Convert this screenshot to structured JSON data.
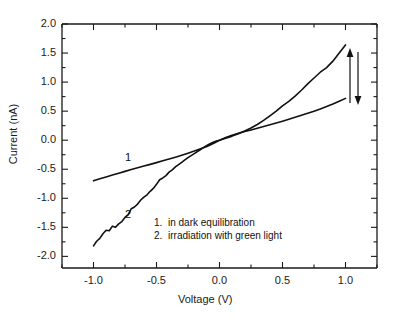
{
  "figure": {
    "background_color": "#ffffff",
    "line_color": "#111111",
    "axis_color": "#1a1a1a",
    "bottom_fragment": ""
  },
  "chart_data": {
    "type": "line",
    "title": "",
    "xlabel": "Voltage (V)",
    "ylabel": "Current (nA)",
    "xlim": [
      -1.25,
      1.25
    ],
    "ylim": [
      -2.2,
      2.0
    ],
    "xticks": [
      "-1.0",
      "-0.5",
      "0.0",
      "0.5",
      "1.0"
    ],
    "xtick_values": [
      -1.0,
      -0.5,
      0.0,
      0.5,
      1.0
    ],
    "yticks": [
      "2.0",
      "1.5",
      "1.0",
      "0.5",
      "0.0",
      "-0.5",
      "-1.0",
      "-1.5",
      "-2.0"
    ],
    "ytick_values": [
      2.0,
      1.5,
      1.0,
      0.5,
      0.0,
      -0.5,
      -1.0,
      -1.5,
      -2.0
    ],
    "minor_ticks": true,
    "grid": false,
    "frame": "box",
    "legend_position": "lower-center-right",
    "legend": [
      {
        "number": "1.",
        "label": "in dark equilibration"
      },
      {
        "number": "2.",
        "label": "irradiation with green light"
      }
    ],
    "annotations": [
      {
        "name": "curve-1-tag",
        "text": "1",
        "x": -0.75,
        "y": -0.3
      },
      {
        "name": "curve-2-tag",
        "text": "2",
        "x": -0.75,
        "y": -1.28
      },
      {
        "name": "arrow-up",
        "direction": "up",
        "x": 1.05,
        "y_from": -0.1,
        "y_to": 1.52
      },
      {
        "name": "arrow-down",
        "direction": "down",
        "x": 1.12,
        "y_from": 1.52,
        "y_to": -0.1
      }
    ],
    "series": [
      {
        "name": "in dark equilibration",
        "tag": "1",
        "x": [
          -1.0,
          -0.95,
          -0.9,
          -0.85,
          -0.8,
          -0.75,
          -0.7,
          -0.65,
          -0.6,
          -0.55,
          -0.5,
          -0.45,
          -0.4,
          -0.35,
          -0.3,
          -0.25,
          -0.2,
          -0.15,
          -0.1,
          -0.05,
          0.0,
          0.05,
          0.1,
          0.15,
          0.2,
          0.25,
          0.3,
          0.35,
          0.4,
          0.45,
          0.5,
          0.55,
          0.6,
          0.65,
          0.7,
          0.75,
          0.8,
          0.85,
          0.9,
          0.95,
          1.0
        ],
        "y": [
          -0.7,
          -0.665,
          -0.632,
          -0.6,
          -0.568,
          -0.537,
          -0.506,
          -0.476,
          -0.446,
          -0.416,
          -0.386,
          -0.355,
          -0.324,
          -0.292,
          -0.258,
          -0.223,
          -0.187,
          -0.148,
          -0.108,
          -0.058,
          0.0,
          0.046,
          0.085,
          0.118,
          0.148,
          0.177,
          0.206,
          0.236,
          0.266,
          0.296,
          0.327,
          0.36,
          0.394,
          0.429,
          0.464,
          0.5,
          0.538,
          0.578,
          0.622,
          0.67,
          0.72
        ]
      },
      {
        "name": "irradiation with green light",
        "tag": "2",
        "x": [
          -1.0,
          -0.975,
          -0.95,
          -0.925,
          -0.9,
          -0.875,
          -0.85,
          -0.825,
          -0.8,
          -0.775,
          -0.75,
          -0.725,
          -0.7,
          -0.675,
          -0.65,
          -0.625,
          -0.6,
          -0.575,
          -0.55,
          -0.525,
          -0.5,
          -0.475,
          -0.45,
          -0.425,
          -0.4,
          -0.375,
          -0.35,
          -0.325,
          -0.3,
          -0.275,
          -0.25,
          -0.225,
          -0.2,
          -0.175,
          -0.15,
          -0.125,
          -0.1,
          -0.075,
          -0.05,
          -0.025,
          0.0,
          0.05,
          0.1,
          0.15,
          0.2,
          0.25,
          0.3,
          0.35,
          0.4,
          0.45,
          0.5,
          0.55,
          0.6,
          0.65,
          0.7,
          0.75,
          0.8,
          0.85,
          0.9,
          0.95,
          1.0
        ],
        "y": [
          -1.82,
          -1.74,
          -1.69,
          -1.61,
          -1.55,
          -1.56,
          -1.48,
          -1.5,
          -1.44,
          -1.4,
          -1.33,
          -1.28,
          -1.18,
          -1.15,
          -1.1,
          -1.03,
          -0.98,
          -0.94,
          -0.88,
          -0.83,
          -0.76,
          -0.68,
          -0.65,
          -0.61,
          -0.55,
          -0.51,
          -0.46,
          -0.42,
          -0.38,
          -0.34,
          -0.3,
          -0.265,
          -0.23,
          -0.195,
          -0.16,
          -0.125,
          -0.09,
          -0.06,
          -0.035,
          -0.015,
          0.0,
          0.035,
          0.07,
          0.11,
          0.16,
          0.21,
          0.27,
          0.34,
          0.42,
          0.5,
          0.59,
          0.67,
          0.76,
          0.86,
          0.97,
          1.07,
          1.17,
          1.25,
          1.36,
          1.5,
          1.64
        ]
      }
    ]
  }
}
